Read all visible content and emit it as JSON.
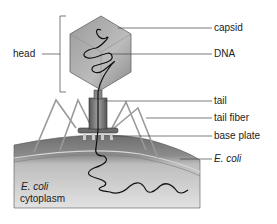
{
  "diagram": {
    "labels": {
      "head": "head",
      "capsid": "capsid",
      "dna": "DNA",
      "tail": "tail",
      "tail_fiber": "tail fiber",
      "base_plate": "base plate",
      "ecoli": "E. coli",
      "cytoplasm_line1": "E. coli",
      "cytoplasm_line2": "cytoplasm"
    }
  }
}
